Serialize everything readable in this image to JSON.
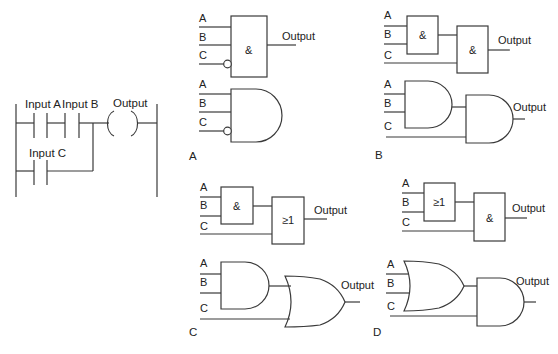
{
  "ladder": {
    "labels": {
      "input_a": "Input A",
      "input_b": "Input B",
      "input_c": "Input C",
      "output": "Output"
    }
  },
  "panels": [
    {
      "id": "A",
      "label": "A",
      "inputs": [
        "A",
        "B",
        "C"
      ],
      "output": "Output",
      "box_symbol": "&",
      "note": "AND with inverted C input (block and distinctive shape)"
    },
    {
      "id": "B",
      "label": "B",
      "inputs": [
        "A",
        "B",
        "C"
      ],
      "output": "Output",
      "box_symbols": [
        "&",
        "&"
      ],
      "note": "Two cascaded AND gates"
    },
    {
      "id": "C",
      "label": "C",
      "inputs": [
        "A",
        "B",
        "C"
      ],
      "output": "Output",
      "box_symbols": [
        "&",
        "≥1"
      ],
      "note": "AND followed by OR"
    },
    {
      "id": "D",
      "label": "D",
      "inputs": [
        "A",
        "B",
        "C"
      ],
      "output": "Output",
      "box_symbols": [
        "≥1",
        "&"
      ],
      "note": "OR followed by AND"
    }
  ]
}
